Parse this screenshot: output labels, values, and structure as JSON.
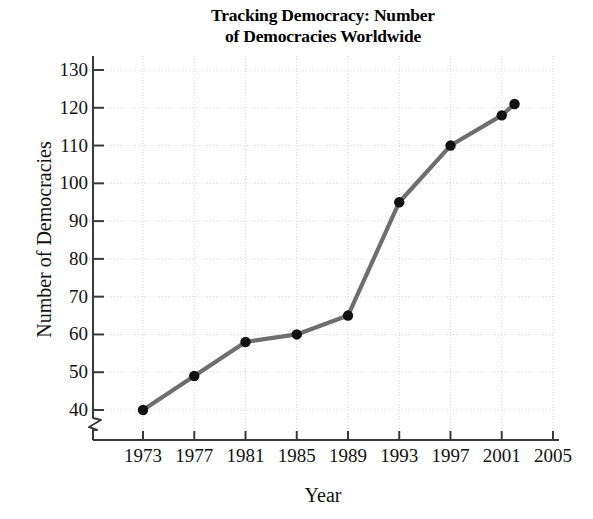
{
  "chart_data": {
    "type": "line",
    "title": "Tracking Democracy: Number of Democracies Worldwide",
    "title_lines": [
      "Tracking Democracy: Number",
      "of Democracies Worldwide"
    ],
    "xlabel": "Year",
    "ylabel": "Number of Democracies",
    "x": [
      1973,
      1977,
      1981,
      1985,
      1989,
      1993,
      1997,
      2001,
      2002
    ],
    "values": [
      40,
      49,
      58,
      60,
      65,
      95,
      110,
      118,
      121
    ],
    "series": [
      {
        "name": "Number of Democracies Worldwide",
        "x": [
          1973,
          1977,
          1981,
          1985,
          1989,
          1993,
          1997,
          2001,
          2002
        ],
        "values": [
          40,
          49,
          58,
          60,
          65,
          95,
          110,
          118,
          121
        ]
      }
    ],
    "xlim": [
      1969,
      2005
    ],
    "ylim": [
      36,
      130
    ],
    "xticks": [
      1973,
      1977,
      1981,
      1985,
      1989,
      1993,
      1997,
      2001,
      2005
    ],
    "xtick_labels": [
      "1973",
      "1977",
      "1981",
      "1985",
      "1989",
      "1993",
      "1997",
      "2001",
      "2005"
    ],
    "yticks": [
      40,
      50,
      60,
      70,
      80,
      90,
      100,
      110,
      120,
      130
    ],
    "ytick_labels": [
      "40",
      "50",
      "60",
      "70",
      "80",
      "90",
      "100",
      "110",
      "120",
      "130"
    ],
    "grid": true,
    "grid_style": "dotted",
    "legend": false,
    "legend_position": "none",
    "y_axis_break": true,
    "y_axis_break_note": "zigzag break on vertical axis below the 40 tick",
    "colors": {
      "line": "#6e6e6e",
      "marker": "#111111",
      "grid": "#d8d8d8",
      "axis": "#3a3a3a",
      "text": "#111111",
      "background": "#ffffff"
    }
  }
}
